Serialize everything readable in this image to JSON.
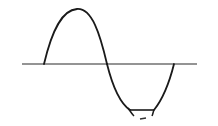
{
  "diagram": {
    "type": "waveform",
    "colors": {
      "background": "#ffffff",
      "stroke": "#1a1a1a"
    },
    "axis": {
      "x1": 22,
      "y": 64,
      "x2": 197
    },
    "waveform": {
      "start_x": 44,
      "positive_peak": {
        "x": 77,
        "y": 9
      },
      "zero_crossing_x": 107,
      "clip_level_y": 110,
      "clip_start_x": 130,
      "clip_end_x": 154,
      "end_x": 174
    },
    "marker": {
      "x1": 140,
      "y1": 119,
      "x2": 145,
      "y2": 118
    }
  }
}
